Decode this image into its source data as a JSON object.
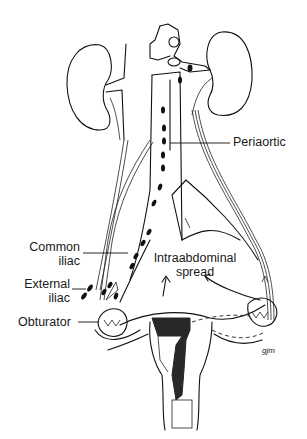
{
  "figure": {
    "style": "black line drawing on white",
    "colors": {
      "background": "#ffffff",
      "ink": "#111111"
    },
    "labels": {
      "periaortic": "Periaortic",
      "common_iliac_line1": "Common",
      "common_iliac_line2": "iliac",
      "external_iliac_line1": "External",
      "external_iliac_line2": "iliac",
      "obturator": "Obturator",
      "intraabdominal_line1": "Intraabdominal",
      "intraabdominal_line2": "spread"
    },
    "signature": "gjm"
  }
}
